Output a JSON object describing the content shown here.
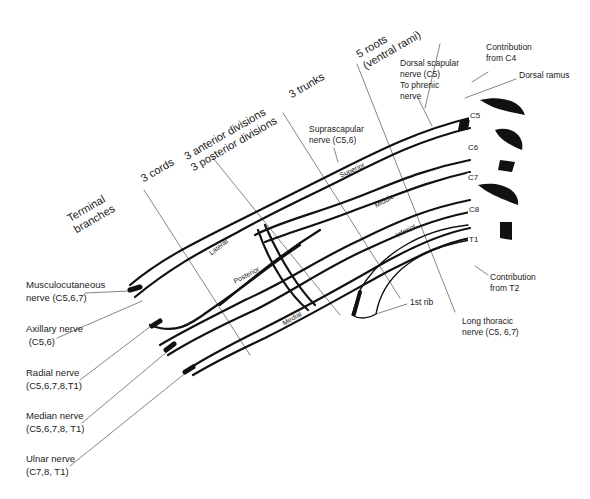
{
  "diagram": {
    "section_headers": [
      {
        "id": "terminal",
        "text": "Terminal\nbranches"
      },
      {
        "id": "cords",
        "text": "3 cords"
      },
      {
        "id": "divisions",
        "text": "3 anterior divisions\n3 posterior divisions"
      },
      {
        "id": "trunks",
        "text": "3 trunks"
      },
      {
        "id": "roots",
        "text": "5 roots\n(ventral rami)"
      }
    ],
    "top_labels": {
      "dorsal_scapular": "Dorsal scapular\nnerve (C5)",
      "phrenic": "To phrenic\nnerve",
      "contribution_c4": "Contribution\nfrom C4",
      "dorsal_ramus": "Dorsal ramus",
      "suprascapular": "Suprascapular\nnerve (C5,6)"
    },
    "roots": [
      "C5",
      "C6",
      "C7",
      "C8",
      "T1"
    ],
    "trunks": [
      "Superior",
      "Middle",
      "Inferior"
    ],
    "cords": [
      "Lateral",
      "Posterior",
      "Medial"
    ],
    "right_labels": {
      "contribution_t2": "Contribution\nfrom T2",
      "first_rib": "1st rib",
      "long_thoracic": "Long thoracic\nnerve (C5, 6,7)"
    },
    "terminal_branches": [
      {
        "name": "Musculocutaneous\nnerve (C5,6,7)"
      },
      {
        "name": "Axillary nerve\n (C5,6)"
      },
      {
        "name": "Radial nerve\n(C5,6,7,8,T1)"
      },
      {
        "name": "Median nerve\n(C5,6,7,8, T1)"
      },
      {
        "name": "Ulnar nerve\n(C7,8, T1)"
      }
    ]
  }
}
